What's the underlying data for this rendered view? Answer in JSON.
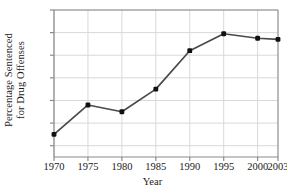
{
  "chart_data": {
    "type": "line",
    "title": "",
    "xlabel": "Year",
    "ylabel": "Percentage Sentenced for Drug Offenses",
    "ylabel_line1": "Percentage Sentenced",
    "ylabel_line2": "for Drug Offenses",
    "x": [
      1970,
      1975,
      1980,
      1985,
      1990,
      1995,
      2000,
      2003
    ],
    "values": [
      15,
      28,
      25,
      35,
      52,
      59.5,
      57.5,
      57
    ],
    "xtick_labels": [
      "1970",
      "1975",
      "1980",
      "1985",
      "1990",
      "1995",
      "2000",
      "2003"
    ],
    "ytick_labels": [
      "10%",
      "20%",
      "30%",
      "40%",
      "50%",
      "60%",
      "70%"
    ],
    "ytick_values": [
      10,
      20,
      30,
      40,
      50,
      60,
      70
    ],
    "xlim": [
      1970,
      2003
    ],
    "ylim": [
      5,
      70
    ],
    "grid": true,
    "legend": "none",
    "line_color": "#4a4a4a",
    "marker_color": "#111111",
    "grid_color": "#d8d8d8",
    "axis_color": "#8a8a8a",
    "background": "#ffffff"
  }
}
